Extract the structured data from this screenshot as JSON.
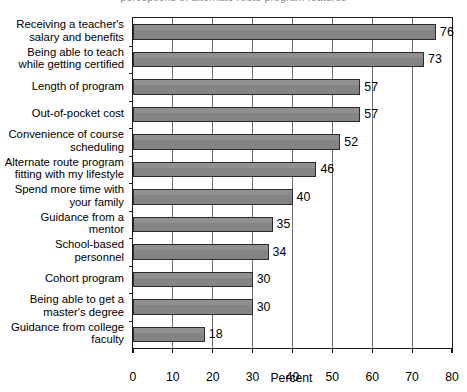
{
  "figure": {
    "cut_title_sliver": "perceptions of alternate route program features",
    "background": "#ffffff",
    "bar_color": "#848484",
    "bar_edge_color": "#2b2b2b",
    "grid_color": "#6f6f6f",
    "axis_color": "#1a1a1a"
  },
  "chart_data": {
    "type": "bar",
    "orientation": "horizontal",
    "title": "",
    "xlabel": "Percent",
    "ylabel": "",
    "xlim": [
      0,
      80
    ],
    "xticks": [
      0,
      10,
      20,
      30,
      40,
      50,
      60,
      70,
      80
    ],
    "xticklabels": [
      "0",
      "10",
      "20",
      "30",
      "40",
      "50",
      "60",
      "70",
      "80"
    ],
    "grid": true,
    "grid_axis": "x",
    "legend": false,
    "categories": [
      "Receiving a teacher's salary and benefits",
      "Being able to teach while getting certified",
      "Length of program",
      "Out-of-pocket cost",
      "Convenience of course scheduling",
      "Alternate route program fitting with my lifestyle",
      "Spend more time with your family",
      "Guidance from a mentor",
      "School-based personnel",
      "Cohort program",
      "Being able to get a master's degree",
      "Guidance from college faculty"
    ],
    "category_lines": [
      [
        "Receiving a teacher's",
        "salary and benefits"
      ],
      [
        "Being able to teach",
        "while getting certified"
      ],
      [
        "Length of program"
      ],
      [
        "Out-of-pocket cost"
      ],
      [
        "Convenience of course",
        "scheduling"
      ],
      [
        "Alternate route program",
        "fitting with my lifestyle"
      ],
      [
        "Spend more time with",
        "your family"
      ],
      [
        "Guidance from a",
        "mentor"
      ],
      [
        "School-based",
        "personnel"
      ],
      [
        "Cohort program"
      ],
      [
        "Being able to get a",
        "master's degree"
      ],
      [
        "Guidance from college",
        "faculty"
      ]
    ],
    "values": [
      76,
      73,
      57,
      57,
      52,
      46,
      40,
      35,
      34,
      30,
      30,
      18
    ],
    "value_labels": [
      "76",
      "73",
      "57",
      "57",
      "52",
      "46",
      "40",
      "35",
      "34",
      "30",
      "30",
      "18"
    ]
  }
}
